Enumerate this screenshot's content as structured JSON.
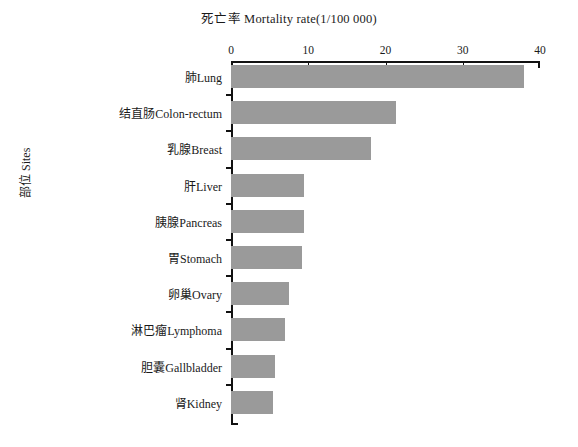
{
  "chart_data": {
    "type": "bar",
    "orientation": "horizontal",
    "title": "死亡率  Mortality rate(1/100 000)",
    "xlabel": "",
    "ylabel": "部位 Sites",
    "xlim": [
      0,
      40
    ],
    "xticks": [
      0,
      10,
      20,
      30,
      40
    ],
    "grid": false,
    "legend": "none",
    "bar_color": "#9a9a9a",
    "axis_color": "#111111",
    "categories": [
      "肺Lung",
      "结直肠Colon-rectum",
      "乳腺Breast",
      "肝Liver",
      "胰腺Pancreas",
      "胃Stomach",
      "卵巢Ovary",
      "淋巴瘤Lymphoma",
      "胆囊Gallbladder",
      "肾Kidney"
    ],
    "values": [
      37.9,
      21.3,
      18.1,
      9.4,
      9.4,
      9.2,
      7.5,
      7.0,
      5.7,
      5.4
    ]
  }
}
